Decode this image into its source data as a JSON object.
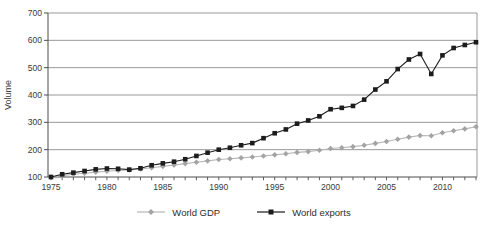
{
  "chart_data": {
    "type": "line",
    "ylabel": "Volume",
    "ylim": [
      100,
      700
    ],
    "yticks": [
      100,
      200,
      300,
      400,
      500,
      600,
      700
    ],
    "xtick_labels": [
      1975,
      1980,
      1985,
      1990,
      1995,
      2000,
      2005,
      2010
    ],
    "grid": "horizontal",
    "legend_position": "bottom-center",
    "x": [
      1975,
      1976,
      1977,
      1978,
      1979,
      1980,
      1981,
      1982,
      1983,
      1984,
      1985,
      1986,
      1987,
      1988,
      1989,
      1990,
      1991,
      1992,
      1993,
      1994,
      1995,
      1996,
      1997,
      1998,
      1999,
      2000,
      2001,
      2002,
      2003,
      2004,
      2005,
      2006,
      2007,
      2008,
      2009,
      2010,
      2011,
      2012,
      2013
    ],
    "series": [
      {
        "name": "World GDP",
        "marker": "diamond",
        "color": "#b7b7b7",
        "marker_fill": "#a3a3a3",
        "values": [
          100,
          105,
          110,
          114,
          118,
          121,
          124,
          126,
          129,
          134,
          139,
          144,
          149,
          154,
          159,
          164,
          167,
          170,
          173,
          177,
          181,
          185,
          190,
          193,
          198,
          204,
          207,
          211,
          216,
          223,
          230,
          238,
          246,
          252,
          251,
          262,
          269,
          276,
          284
        ]
      },
      {
        "name": "World exports",
        "marker": "square",
        "color": "#1c1c1c",
        "marker_fill": "#1c1c1c",
        "values": [
          100,
          110,
          116,
          122,
          128,
          131,
          130,
          127,
          132,
          143,
          150,
          156,
          165,
          177,
          189,
          200,
          207,
          216,
          224,
          242,
          260,
          274,
          295,
          307,
          322,
          348,
          353,
          360,
          383,
          420,
          450,
          495,
          530,
          550,
          477,
          545,
          572,
          583,
          593
        ]
      }
    ],
    "colors": {
      "grid": "#999999",
      "axis": "#4d4d4d",
      "text": "#3a3a3a",
      "background": "#ffffff"
    }
  }
}
